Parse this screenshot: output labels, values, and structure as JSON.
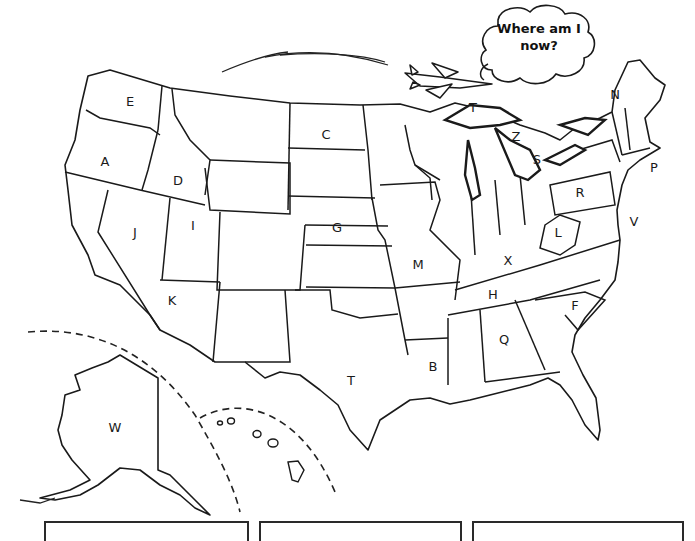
{
  "worksheet": {
    "speech_bubble": {
      "line1": "Where am I",
      "line2": "now?"
    },
    "map_labels": [
      {
        "id": "E",
        "text": "E",
        "x": 130,
        "y": 101
      },
      {
        "id": "A",
        "text": "A",
        "x": 105,
        "y": 161
      },
      {
        "id": "D",
        "text": "D",
        "x": 178,
        "y": 180
      },
      {
        "id": "J",
        "text": "J",
        "x": 135,
        "y": 232
      },
      {
        "id": "I",
        "text": "I",
        "x": 193,
        "y": 225
      },
      {
        "id": "K",
        "text": "K",
        "x": 172,
        "y": 300
      },
      {
        "id": "C",
        "text": "C",
        "x": 326,
        "y": 134
      },
      {
        "id": "G",
        "text": "G",
        "x": 337,
        "y": 227
      },
      {
        "id": "T-north",
        "text": "T",
        "x": 473,
        "y": 107
      },
      {
        "id": "Z",
        "text": "Z",
        "x": 516,
        "y": 136
      },
      {
        "id": "S",
        "text": "S",
        "x": 537,
        "y": 159
      },
      {
        "id": "N",
        "text": "N",
        "x": 615,
        "y": 94
      },
      {
        "id": "P",
        "text": "P",
        "x": 654,
        "y": 167
      },
      {
        "id": "R",
        "text": "R",
        "x": 580,
        "y": 192
      },
      {
        "id": "V",
        "text": "V",
        "x": 634,
        "y": 221
      },
      {
        "id": "L",
        "text": "L",
        "x": 558,
        "y": 232
      },
      {
        "id": "M",
        "text": "M",
        "x": 418,
        "y": 264
      },
      {
        "id": "X",
        "text": "X",
        "x": 508,
        "y": 260
      },
      {
        "id": "H",
        "text": "H",
        "x": 493,
        "y": 294
      },
      {
        "id": "F",
        "text": "F",
        "x": 575,
        "y": 305
      },
      {
        "id": "Q",
        "text": "Q",
        "x": 504,
        "y": 339
      },
      {
        "id": "B",
        "text": "B",
        "x": 433,
        "y": 366
      },
      {
        "id": "T-south",
        "text": "T",
        "x": 351,
        "y": 380
      },
      {
        "id": "W",
        "text": "W",
        "x": 115,
        "y": 427
      }
    ],
    "answer_boxes": [
      {
        "id": "box-1",
        "value": ""
      },
      {
        "id": "box-2",
        "value": ""
      },
      {
        "id": "box-3",
        "value": ""
      }
    ],
    "colors": {
      "ink": "#1a1a1a",
      "paper": "#ffffff"
    }
  }
}
